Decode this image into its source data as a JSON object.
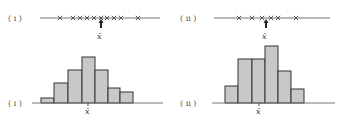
{
  "panels": [
    {
      "id": "i",
      "dot_label": "( i )",
      "hist_label": "( i )",
      "mean_label": "x̄",
      "dot_plot": {
        "line": {
          "x1": 40,
          "x2": 160,
          "y": 18
        },
        "crosses_x": [
          60,
          73,
          80,
          87,
          94,
          101,
          107,
          114,
          121,
          138
        ],
        "mean_x": 101
      },
      "histogram": {
        "baseline": {
          "x1": 32,
          "x2": 163,
          "y": 103
        },
        "bars": [
          {
            "x": 41,
            "w": 13,
            "top": 98
          },
          {
            "x": 54,
            "w": 14,
            "top": 83
          },
          {
            "x": 68,
            "w": 14,
            "top": 70
          },
          {
            "x": 82,
            "w": 13,
            "top": 57
          },
          {
            "x": 95,
            "w": 13,
            "top": 70
          },
          {
            "x": 108,
            "w": 12,
            "top": 88
          },
          {
            "x": 120,
            "w": 13,
            "top": 92
          }
        ],
        "mean_x": 88
      }
    },
    {
      "id": "ii",
      "dot_label": "( ii )",
      "hist_label": "( ii )",
      "mean_label": "x̄",
      "dot_plot": {
        "line": {
          "x1": 214,
          "x2": 330,
          "y": 18
        },
        "crosses_x": [
          239,
          252,
          262,
          271,
          278,
          296
        ],
        "mean_x": 266
      },
      "histogram": {
        "baseline": {
          "x1": 212,
          "x2": 335,
          "y": 103
        },
        "bars": [
          {
            "x": 225,
            "w": 13,
            "top": 86
          },
          {
            "x": 238,
            "w": 14,
            "top": 59
          },
          {
            "x": 252,
            "w": 13,
            "top": 59
          },
          {
            "x": 265,
            "w": 13,
            "top": 46
          },
          {
            "x": 278,
            "w": 13,
            "top": 71
          },
          {
            "x": 291,
            "w": 13,
            "top": 89
          }
        ],
        "mean_x": 259
      }
    }
  ]
}
